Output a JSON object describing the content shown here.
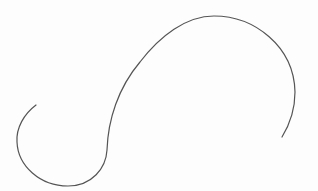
{
  "figure": {
    "background_color": "#fdfdfd",
    "stroke_color": "#555555",
    "stroke_width": 1.2,
    "curve": {
      "start": [
        36,
        105
      ],
      "end": [
        282,
        137
      ],
      "points_of_interest": {
        "leftmost": [
          17,
          140
        ],
        "bottom": [
          70,
          186
        ],
        "inflection": [
          108,
          148
        ],
        "top": [
          212,
          16
        ],
        "rightmost": [
          295,
          92
        ]
      }
    }
  }
}
